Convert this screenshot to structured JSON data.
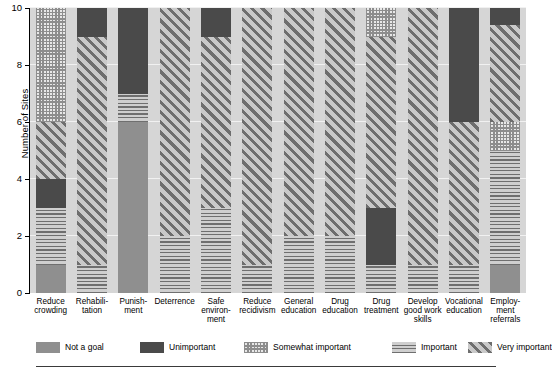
{
  "chart_data": {
    "type": "bar",
    "subtype": "stacked-bar",
    "title": "",
    "xlabel": "",
    "ylabel": "Number of Sites",
    "ylim": [
      0,
      10
    ],
    "yticks": [
      0,
      2,
      4,
      6,
      8,
      10
    ],
    "ytick_labels": [
      "0",
      "2",
      "4",
      "6",
      "8",
      "10"
    ],
    "grid": true,
    "grid_axis": "y",
    "legend_position": "bottom",
    "plot_background": "#d6d6d6",
    "categories": [
      "Reduce\ncrowding",
      "Rehabili-\ntation",
      "Punish-\nment",
      "Deterrence",
      "Safe\nenviron-\nment",
      "Reduce\nrecidivism",
      "General\neducation",
      "Drug\neducation",
      "Drug\ntreatment",
      "Develop\ngood work\nskills",
      "Vocational\neducation",
      "Employ-\nment\nreferrals"
    ],
    "series": [
      {
        "name": "Not a goal",
        "pattern": "solid-gray",
        "color": "#8f8f8f",
        "values": [
          1,
          0,
          6,
          0,
          0,
          0,
          0,
          0,
          0,
          0,
          0,
          1
        ]
      },
      {
        "name": "Important",
        "pattern": "horizontal-lines",
        "color": "#cfcfcf",
        "values": [
          2,
          1,
          1,
          2,
          3,
          1,
          2,
          2,
          1,
          1,
          1,
          4
        ]
      },
      {
        "name": "Unimportant",
        "pattern": "solid-dark",
        "color": "#4a4a4a",
        "values": [
          1,
          0,
          3,
          0,
          0,
          0,
          0,
          0,
          2,
          0,
          0,
          0
        ]
      },
      {
        "name": "Very important",
        "pattern": "diagonal-hatch",
        "color": "#c9c9c9",
        "values": [
          2,
          8,
          0,
          8,
          6,
          9,
          8,
          8,
          6,
          9,
          5,
          3
        ]
      },
      {
        "name": "Somewhat important",
        "pattern": "checkerboard",
        "color": "#e8e8e8",
        "values": [
          4,
          0,
          0,
          0,
          0,
          0,
          0,
          0,
          1,
          0,
          0,
          1
        ]
      },
      {
        "name": "Unimportant (top)",
        "pattern": "solid-dark",
        "color": "#4a4a4a",
        "values": [
          0,
          1,
          0,
          0,
          1,
          0,
          0,
          0,
          0,
          0,
          4,
          1
        ]
      }
    ],
    "stacks": [
      {
        "category": "Reduce crowding",
        "segments": [
          {
            "series": "Not a goal",
            "from": 0,
            "to": 1
          },
          {
            "series": "Important",
            "from": 1,
            "to": 3
          },
          {
            "series": "Unimportant",
            "from": 3,
            "to": 4
          },
          {
            "series": "Very important",
            "from": 4,
            "to": 6
          },
          {
            "series": "Somewhat important",
            "from": 6,
            "to": 10
          }
        ]
      },
      {
        "category": "Rehabilitation",
        "segments": [
          {
            "series": "Important",
            "from": 0,
            "to": 1
          },
          {
            "series": "Very important",
            "from": 1,
            "to": 9
          },
          {
            "series": "Unimportant",
            "from": 9,
            "to": 10
          }
        ]
      },
      {
        "category": "Punishment",
        "segments": [
          {
            "series": "Not a goal",
            "from": 0,
            "to": 6
          },
          {
            "series": "Important",
            "from": 6,
            "to": 7
          },
          {
            "series": "Unimportant",
            "from": 7,
            "to": 10
          }
        ]
      },
      {
        "category": "Deterrence",
        "segments": [
          {
            "series": "Important",
            "from": 0,
            "to": 2
          },
          {
            "series": "Very important",
            "from": 2,
            "to": 10
          }
        ]
      },
      {
        "category": "Safe environment",
        "segments": [
          {
            "series": "Important",
            "from": 0,
            "to": 3
          },
          {
            "series": "Very important",
            "from": 3,
            "to": 9
          },
          {
            "series": "Unimportant",
            "from": 9,
            "to": 10
          }
        ]
      },
      {
        "category": "Reduce recidivism",
        "segments": [
          {
            "series": "Important",
            "from": 0,
            "to": 1
          },
          {
            "series": "Very important",
            "from": 1,
            "to": 10
          }
        ]
      },
      {
        "category": "General education",
        "segments": [
          {
            "series": "Important",
            "from": 0,
            "to": 2
          },
          {
            "series": "Very important",
            "from": 2,
            "to": 10
          }
        ]
      },
      {
        "category": "Drug education",
        "segments": [
          {
            "series": "Important",
            "from": 0,
            "to": 2
          },
          {
            "series": "Very important",
            "from": 2,
            "to": 10
          }
        ]
      },
      {
        "category": "Drug treatment",
        "segments": [
          {
            "series": "Important",
            "from": 0,
            "to": 1
          },
          {
            "series": "Unimportant",
            "from": 1,
            "to": 3
          },
          {
            "series": "Very important",
            "from": 3,
            "to": 9
          },
          {
            "series": "Somewhat important",
            "from": 9,
            "to": 10
          }
        ]
      },
      {
        "category": "Develop good work skills",
        "segments": [
          {
            "series": "Important",
            "from": 0,
            "to": 1
          },
          {
            "series": "Very important",
            "from": 1,
            "to": 10
          }
        ]
      },
      {
        "category": "Vocational education",
        "segments": [
          {
            "series": "Important",
            "from": 0,
            "to": 1
          },
          {
            "series": "Very important",
            "from": 1,
            "to": 6
          },
          {
            "series": "Unimportant",
            "from": 6,
            "to": 10
          }
        ]
      },
      {
        "category": "Employment referrals",
        "segments": [
          {
            "series": "Not a goal",
            "from": 0,
            "to": 1
          },
          {
            "series": "Important",
            "from": 1,
            "to": 5
          },
          {
            "series": "Somewhat important",
            "from": 5,
            "to": 6
          },
          {
            "series": "Very important",
            "from": 6,
            "to": 9.4
          },
          {
            "series": "Unimportant",
            "from": 9.4,
            "to": 10
          }
        ]
      }
    ],
    "legend": [
      {
        "label": "Not a goal",
        "pattern": "solid-gray",
        "color": "#8f8f8f"
      },
      {
        "label": "Unimportant",
        "pattern": "solid-dark",
        "color": "#4a4a4a"
      },
      {
        "label": "Somewhat important",
        "pattern": "checkerboard",
        "color": "#e8e8e8"
      },
      {
        "label": "Important",
        "pattern": "horizontal-lines",
        "color": "#cfcfcf"
      },
      {
        "label": "Very important",
        "pattern": "diagonal-hatch",
        "color": "#c9c9c9"
      }
    ]
  }
}
